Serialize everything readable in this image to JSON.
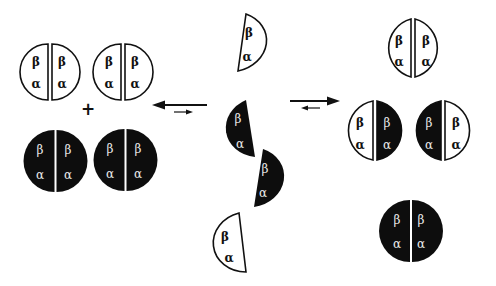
{
  "figure": {
    "colors": {
      "white_subunit": "#ffffff",
      "black_subunit": "#0d0d0d",
      "outline": "#111111",
      "label_on_black": "#e8e8e8"
    },
    "subunit_labels": {
      "beta": "β",
      "alpha": "α"
    },
    "plus_sign": "+",
    "left_group": {
      "white_tetramers": [
        {
          "id": "white-tetramer-1",
          "left": {
            "top": "β",
            "bottom": "α"
          },
          "right": {
            "top": "β",
            "bottom": "α"
          }
        },
        {
          "id": "white-tetramer-2",
          "left": {
            "top": "β",
            "bottom": "α"
          },
          "right": {
            "top": "β",
            "bottom": "α"
          }
        }
      ],
      "black_tetramers": [
        {
          "id": "black-tetramer-1",
          "left": {
            "top": "β",
            "bottom": "α"
          },
          "right": {
            "top": "β",
            "bottom": "α"
          }
        },
        {
          "id": "black-tetramer-2",
          "left": {
            "top": "β",
            "bottom": "α"
          },
          "right": {
            "top": "β",
            "bottom": "α"
          }
        }
      ]
    },
    "left_equilibrium_arrows": {
      "major_direction": "left",
      "minor_direction": "right"
    },
    "center_group": {
      "dimers": [
        {
          "id": "white-dimer-top",
          "color": "white",
          "top": "β",
          "bottom": "α"
        },
        {
          "id": "black-dimer-1",
          "color": "black",
          "top": "β",
          "bottom": "α"
        },
        {
          "id": "black-dimer-2",
          "color": "black",
          "top": "β",
          "bottom": "α"
        },
        {
          "id": "white-dimer-bottom",
          "color": "white",
          "top": "β",
          "bottom": "α"
        }
      ]
    },
    "right_equilibrium_arrows": {
      "major_direction": "right",
      "minor_direction": "left"
    },
    "right_group": {
      "tetramers": [
        {
          "id": "white-tetramer",
          "left": {
            "color": "white",
            "top": "β",
            "bottom": "α"
          },
          "right": {
            "color": "white",
            "top": "β",
            "bottom": "α"
          }
        },
        {
          "id": "hybrid-tetramer-1",
          "left": {
            "color": "white",
            "top": "β",
            "bottom": "α"
          },
          "right": {
            "color": "black",
            "top": "β",
            "bottom": "α"
          }
        },
        {
          "id": "hybrid-tetramer-2",
          "left": {
            "color": "black",
            "top": "β",
            "bottom": "α"
          },
          "right": {
            "color": "white",
            "top": "β",
            "bottom": "α"
          }
        },
        {
          "id": "black-tetramer",
          "left": {
            "color": "black",
            "top": "β",
            "bottom": "α"
          },
          "right": {
            "color": "black",
            "top": "β",
            "bottom": "α"
          }
        }
      ]
    }
  }
}
